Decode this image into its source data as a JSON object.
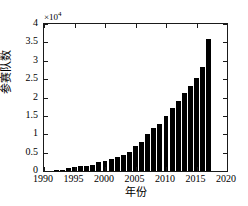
{
  "chart_data": {
    "type": "bar",
    "title": "",
    "subtitle": "",
    "xlabel": "年份",
    "ylabel": "参赛队数",
    "exponent_label": "×10",
    "exponent_power": "4",
    "y_scale_factor": 10000,
    "xlim": [
      1990,
      2020
    ],
    "ylim": [
      0,
      40000
    ],
    "grid": false,
    "legend": null,
    "bar_color": "#000000",
    "axis_color": "#1a1a1a",
    "background_color": "#ffffff",
    "xticks": [
      1990,
      1995,
      2000,
      2005,
      2010,
      2015,
      2020
    ],
    "xtick_labels": [
      "1990",
      "1995",
      "2000",
      "2005",
      "2010",
      "2015",
      "2020"
    ],
    "yticks": [
      0,
      5000,
      10000,
      15000,
      20000,
      25000,
      30000,
      35000,
      40000
    ],
    "ytick_labels": [
      "0",
      "0.5",
      "1",
      "1.5",
      "2",
      "2.5",
      "3",
      "3.5",
      "4"
    ],
    "x": [
      1992,
      1993,
      1994,
      1995,
      1996,
      1997,
      1998,
      1999,
      2000,
      2001,
      2002,
      2003,
      2004,
      2005,
      2006,
      2007,
      2008,
      2009,
      2010,
      2011,
      2012,
      2013,
      2014,
      2015,
      2016,
      2017
    ],
    "categories": [
      "1992",
      "1993",
      "1994",
      "1995",
      "1996",
      "1997",
      "1998",
      "1999",
      "2000",
      "2001",
      "2002",
      "2003",
      "2004",
      "2005",
      "2006",
      "2007",
      "2008",
      "2009",
      "2010",
      "2011",
      "2012",
      "2013",
      "2014",
      "2015",
      "2016",
      "2017"
    ],
    "values": [
      300,
      400,
      900,
      1000,
      1300,
      1300,
      1700,
      2500,
      2700,
      3200,
      3800,
      4400,
      5200,
      6800,
      8000,
      10000,
      11800,
      12800,
      14900,
      17100,
      19100,
      21200,
      23100,
      25300,
      28300,
      31200
    ],
    "values_last_correction": 36000
  },
  "figure": {
    "width": 248,
    "height": 206
  }
}
